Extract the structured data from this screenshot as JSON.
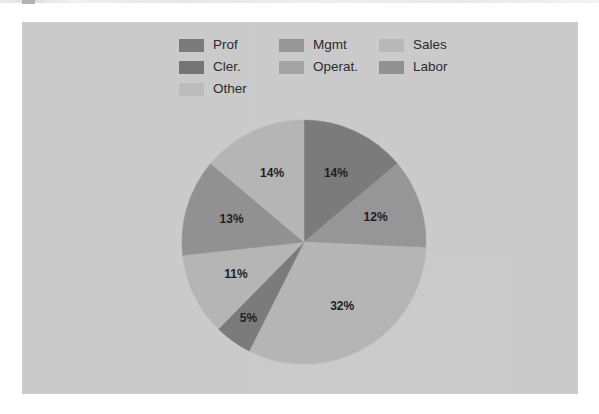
{
  "chart_data": {
    "type": "pie",
    "title": "",
    "subtitle": "",
    "legend_position": "top",
    "grid": false,
    "categories": [
      "Prof",
      "Mgmt",
      "Sales",
      "Cler.",
      "Operat.",
      "Labor",
      "Other"
    ],
    "values": [
      14,
      12,
      32,
      5,
      11,
      13,
      14
    ],
    "data_labels": [
      "14%",
      "12%",
      "32%",
      "5%",
      "11%",
      "13%",
      "14%"
    ],
    "value_unit": "%",
    "start_angle_deg": 0,
    "direction": "clockwise",
    "slices": [
      {
        "label": "Prof",
        "value": 14,
        "data_label": "14%",
        "color": "#7b7b7b",
        "order": 1
      },
      {
        "label": "Mgmt",
        "value": 12,
        "data_label": "12%",
        "color": "#969696",
        "order": 2
      },
      {
        "label": "Sales",
        "value": 32,
        "data_label": "32%",
        "color": "#b5b5b5",
        "order": 3
      },
      {
        "label": "Cler.",
        "value": 5,
        "data_label": "5%",
        "color": "#7b7b7b",
        "order": 4
      },
      {
        "label": "Operat.",
        "value": 11,
        "data_label": "11%",
        "color": "#b5b5b5",
        "order": 5
      },
      {
        "label": "Labor",
        "value": 13,
        "data_label": "13%",
        "color": "#919191",
        "order": 6
      },
      {
        "label": "Other",
        "value": 14,
        "data_label": "14%",
        "color": "#b5b5b5",
        "order": 7
      }
    ]
  },
  "legend": {
    "entries": [
      {
        "label": "Prof",
        "color": "#7b7b7b"
      },
      {
        "label": "Mgmt",
        "color": "#969696"
      },
      {
        "label": "Sales",
        "color": "#b8b8b8"
      },
      {
        "label": "Cler.",
        "color": "#757575"
      },
      {
        "label": "Operat.",
        "color": "#a3a3a3"
      },
      {
        "label": "Labor",
        "color": "#919191"
      },
      {
        "label": "Other",
        "color": "#bcbcbc"
      }
    ]
  },
  "labels": {
    "slice_1": "14%",
    "slice_2": "12%",
    "slice_3": "32%",
    "slice_4": "5%",
    "slice_5": "11%",
    "slice_6": "13%",
    "slice_7": "14%"
  },
  "colors": {
    "panel_background": "#cdcdcd",
    "page_background": "#ffffff",
    "text": "#2b2b2b"
  }
}
